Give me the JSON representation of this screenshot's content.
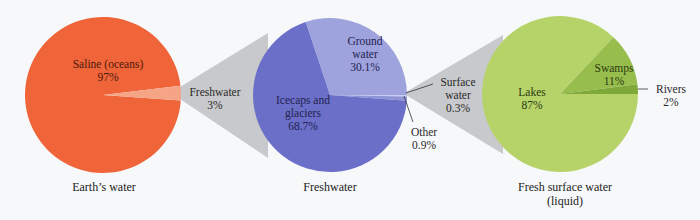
{
  "chart_data": [
    {
      "type": "pie",
      "title": "Earth's water",
      "slices": [
        {
          "label": "Saline (oceans)",
          "value": 97,
          "display": "97%",
          "color": "#f0643a"
        },
        {
          "label": "Freshwater",
          "value": 3,
          "display": "3%",
          "color": "#f5a486"
        }
      ]
    },
    {
      "type": "pie",
      "title": "Freshwater",
      "slices": [
        {
          "label": "Ground water",
          "value": 30.1,
          "display": "30.1%",
          "color": "#9ea3dd"
        },
        {
          "label": "Surface water",
          "value": 0.3,
          "display": "0.3%",
          "color": "#c9ccef"
        },
        {
          "label": "Other",
          "value": 0.9,
          "display": "0.9%",
          "color": "#8f94d6"
        },
        {
          "label": "Icecaps and glaciers",
          "value": 68.7,
          "display": "68.7%",
          "color": "#6b6fc8"
        }
      ]
    },
    {
      "type": "pie",
      "title": "Fresh surface water (liquid)",
      "slices": [
        {
          "label": "Lakes",
          "value": 87,
          "display": "87%",
          "color": "#b6d36a"
        },
        {
          "label": "Swamps",
          "value": 11,
          "display": "11%",
          "color": "#97be4c"
        },
        {
          "label": "Rivers",
          "value": 2,
          "display": "2%",
          "color": "#7ea838"
        }
      ]
    }
  ],
  "labels": {
    "saline_name": "Saline (oceans)",
    "saline_pct": "97%",
    "freshwater_name": "Freshwater",
    "freshwater_pct": "3%",
    "ground_name1": "Ground",
    "ground_name2": "water",
    "ground_pct": "30.1%",
    "icecaps_name1": "Icecaps and",
    "icecaps_name2": "glaciers",
    "icecaps_pct": "68.7%",
    "surface_name1": "Surface",
    "surface_name2": "water",
    "surface_pct": "0.3%",
    "other_name": "Other",
    "other_pct": "0.9%",
    "lakes_name": "Lakes",
    "lakes_pct": "87%",
    "swamps_name": "Swamps",
    "swamps_pct": "11%",
    "rivers_name": "Rivers",
    "rivers_pct": "2%"
  },
  "captions": {
    "pie1": "Earth’s water",
    "pie2": "Freshwater",
    "pie3_line1": "Fresh surface water",
    "pie3_line2": "(liquid)"
  },
  "colors": {
    "funnel": "#c8c9cc",
    "background": "#f7f8fa"
  }
}
